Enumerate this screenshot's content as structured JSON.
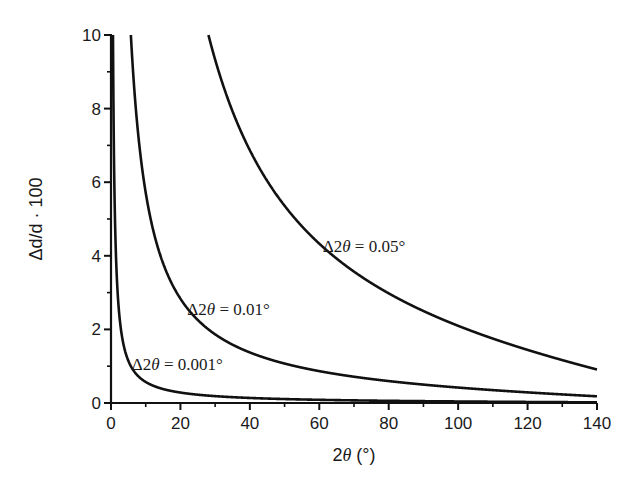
{
  "chart_data": {
    "type": "line",
    "title": "",
    "xlabel": "2θ (°)",
    "ylabel": "Δd/d · 100",
    "xlim": [
      0,
      140
    ],
    "ylim": [
      0,
      10
    ],
    "x_ticks": [
      0,
      20,
      40,
      60,
      80,
      100,
      120,
      140
    ],
    "x_minor_ticks": [
      10,
      30,
      50,
      70,
      90,
      110,
      130
    ],
    "y_ticks": [
      0,
      2,
      4,
      6,
      8,
      10
    ],
    "y_minor_ticks": [
      1,
      3,
      5,
      7,
      9
    ],
    "grid": false,
    "legend": "none (inline annotations)",
    "formula": "Δd/d·100 = 50 · Δ2θ[°] · cot(θ)",
    "series": [
      {
        "name": "Δ2θ = 0.001°",
        "delta": 0.001,
        "x": [
          0.6,
          1,
          2,
          3,
          5,
          10,
          20,
          40,
          60,
          80,
          100,
          120,
          140
        ],
        "values": [
          9.55,
          5.73,
          2.86,
          1.91,
          1.14,
          0.57,
          0.28,
          0.14,
          0.087,
          0.06,
          0.042,
          0.029,
          0.018
        ],
        "label": {
          "text": "Δ2θ = 0.001°",
          "x": 6,
          "y": 0.9
        }
      },
      {
        "name": "Δ2θ = 0.01°",
        "delta": 0.01,
        "x": [
          5.7,
          8,
          10,
          15,
          20,
          30,
          40,
          60,
          80,
          100,
          120,
          140
        ],
        "values": [
          10.0,
          7.15,
          5.72,
          3.8,
          2.84,
          1.87,
          1.37,
          0.87,
          0.6,
          0.42,
          0.29,
          0.18
        ],
        "label": {
          "text": "Δ2θ = 0.01°",
          "x": 22,
          "y": 2.4
        }
      },
      {
        "name": "Δ2θ = 0.05°",
        "delta": 0.05,
        "x": [
          28.2,
          30,
          40,
          50,
          60,
          80,
          100,
          120,
          140
        ],
        "values": [
          10.0,
          9.33,
          6.87,
          5.36,
          4.33,
          2.98,
          2.1,
          1.44,
          0.91
        ],
        "label": {
          "text": "Δ2θ = 0.05°",
          "x": 61,
          "y": 4.1
        }
      }
    ]
  },
  "plot": {
    "left": 111,
    "right": 597,
    "top": 35,
    "bottom": 403
  },
  "labels": {
    "xlabel_main": "2",
    "xlabel_theta": "θ",
    "xlabel_unit": " (°)",
    "ylabel": "Δd/d · 100"
  }
}
